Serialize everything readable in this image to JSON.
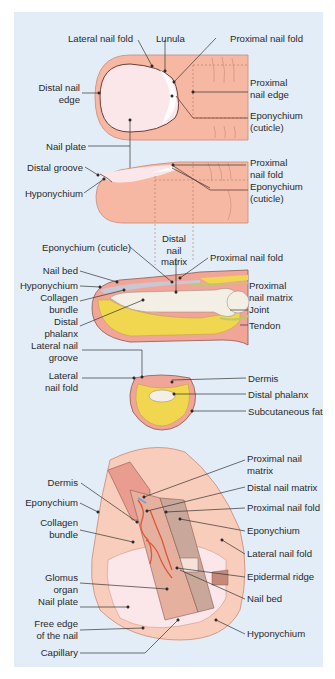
{
  "colors": {
    "background": "#e3edf7",
    "skin": "#f6b8a2",
    "skin_light": "#f9cdbb",
    "nail": "#fbe6ea",
    "outline": "#8c5a4c",
    "fat": "#f1d64f",
    "bone": "#f4efe4",
    "dermis": "#e99c8f",
    "vessel": "#e2553a",
    "tendon": "#b8cc6a",
    "leader": "#333333"
  },
  "panels": {
    "top_view": {
      "labels": {
        "lateral_nail_fold": "Lateral nail fold",
        "lunula": "Lunula",
        "proximal_nail_fold": "Proximal nail fold",
        "distal_nail_edge": "Distal nail\nedge",
        "proximal_nail_edge": "Proximal\nnail edge",
        "eponychium": "Eponychium\n(cuticle)",
        "nail_plate": "Nail plate"
      }
    },
    "side_view": {
      "labels": {
        "distal_groove": "Distal groove",
        "hyponychium": "Hyponychium",
        "proximal_nail_fold": "Proximal\nnail fold",
        "eponychium": "Eponychium\n(cuticle)"
      }
    },
    "sagittal_section": {
      "labels": {
        "distal_nail_matrix": "Distal\nnail\nmatrix",
        "eponychium": "Eponychium (cuticle)",
        "proximal_nail_fold": "Proximal nail fold",
        "nail_bed": "Nail bed",
        "hyponychium": "Hyponychium",
        "collagen_bundle": "Collagen\nbundle",
        "distal_phalanx": "Distal\nphalanx",
        "proximal_nail_matrix": "Proximal\nnail matrix",
        "joint": "Joint",
        "tendon": "Tendon"
      }
    },
    "cross_section": {
      "labels": {
        "lateral_nail_groove": "Lateral nail\ngroove",
        "lateral_nail_fold": "Lateral\nnail fold",
        "dermis": "Dermis",
        "distal_phalanx": "Distal phalanx",
        "subcutaneous_fat": "Subcutaneous fat"
      }
    },
    "cutaway_view": {
      "labels": {
        "dermis": "Dermis",
        "eponychium_left": "Eponychium",
        "collagen_bundle": "Collagen\nbundle",
        "glomus_organ": "Glomus\norgan",
        "nail_plate": "Nail plate",
        "free_edge": "Free edge\nof the nail",
        "capillary": "Capillary",
        "proximal_nail_matrix": "Proximal nail\nmatrix",
        "distal_nail_matrix": "Distal nail matrix",
        "proximal_nail_fold": "Proximal nail fold",
        "eponychium_right": "Eponychium",
        "lateral_nail_fold": "Lateral nail fold",
        "epidermal_ridge": "Epidermal ridge",
        "nail_bed": "Nail bed",
        "hyponychium": "Hyponychium"
      }
    }
  }
}
